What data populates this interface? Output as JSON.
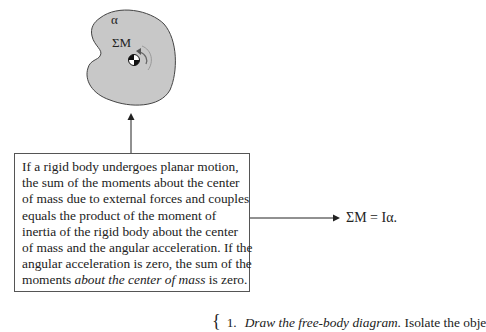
{
  "figure": {
    "body_labels": {
      "sum_moments": "ΣM",
      "alpha": "α"
    },
    "colors": {
      "body_fill": "#c8c8c8",
      "body_stroke": "#444444",
      "line": "#222222"
    }
  },
  "callout": {
    "lines": [
      "If a rigid body undergoes planar motion,",
      "the sum of the moments about the center",
      "of mass due to external forces and couples",
      "equals the product of the moment of",
      "inertia of the rigid body about the center",
      "of mass and the angular acceleration. If the",
      "angular acceleration is zero, the sum of the"
    ],
    "last_line_prefix": "moments ",
    "last_line_italic": "about the center of mass",
    "last_line_suffix": " is zero."
  },
  "equation": "ΣM = Iα.",
  "step": {
    "brace": "{",
    "number": "1.",
    "italic": "Draw the free-body diagram.",
    "rest": " Isolate the obje"
  }
}
